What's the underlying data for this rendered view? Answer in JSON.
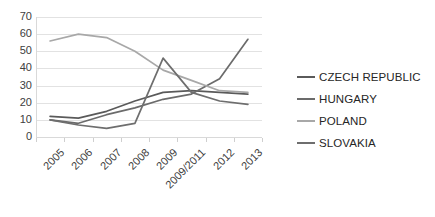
{
  "chart_data": {
    "type": "line",
    "title": "",
    "xlabel": "",
    "ylabel": "",
    "ylim": [
      0,
      70
    ],
    "ytick_step": 10,
    "grid": true,
    "legend_position": "right",
    "categories": [
      "2005",
      "2006",
      "2007",
      "2008",
      "2009",
      "2009/2011",
      "2012",
      "2013"
    ],
    "yticks": [
      "70",
      "60",
      "50",
      "40",
      "30",
      "20",
      "10",
      "0"
    ],
    "series": [
      {
        "name": "CZECH REPUBLIC",
        "color": "#5a5a5a",
        "values": [
          12,
          11,
          15,
          21,
          26,
          27,
          26,
          25
        ]
      },
      {
        "name": "HUNGARY",
        "color": "#6b6b6b",
        "values": [
          10,
          8,
          13,
          17,
          22,
          25,
          34,
          57
        ]
      },
      {
        "name": "POLAND",
        "color": "#a8a8a8",
        "values": [
          56,
          60,
          58,
          50,
          39,
          33,
          27,
          26
        ]
      },
      {
        "name": "SLOVAKIA",
        "color": "#6e6e6e",
        "values": [
          10,
          7,
          5,
          8,
          46,
          26,
          21,
          19
        ]
      }
    ]
  },
  "legend": {
    "items": [
      {
        "label": "CZECH REPUBLIC"
      },
      {
        "label": "HUNGARY"
      },
      {
        "label": "POLAND"
      },
      {
        "label": "SLOVAKIA"
      }
    ]
  }
}
